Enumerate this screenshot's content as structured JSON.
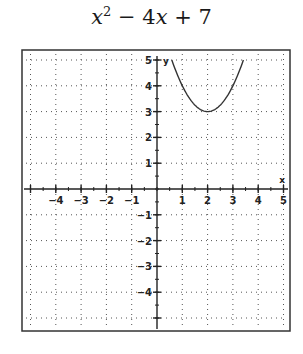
{
  "chart_data": {
    "type": "line",
    "title_parts": {
      "a": "x",
      "exp": "2",
      "rest1": " − 4",
      "b": "x",
      "rest2": " + 7"
    },
    "xlabel": "x",
    "ylabel": "y",
    "xlim": [
      -5,
      5
    ],
    "ylim": [
      -5,
      5
    ],
    "grid": true,
    "x_ticks": [
      -4,
      -3,
      -2,
      -1,
      1,
      2,
      3,
      4,
      5
    ],
    "y_ticks": [
      5,
      4,
      3,
      2,
      1,
      -1,
      -2,
      -3,
      -4
    ],
    "series": [
      {
        "name": "x^2 - 4x + 7",
        "x": [
          0.586,
          1.0,
          1.5,
          2.0,
          2.5,
          3.0,
          3.414
        ],
        "y": [
          5.0,
          4.0,
          3.25,
          3.0,
          3.25,
          4.0,
          5.0
        ]
      }
    ],
    "colors": {
      "curve": "#333333",
      "grid": "#555555",
      "axis": "#222222"
    }
  }
}
